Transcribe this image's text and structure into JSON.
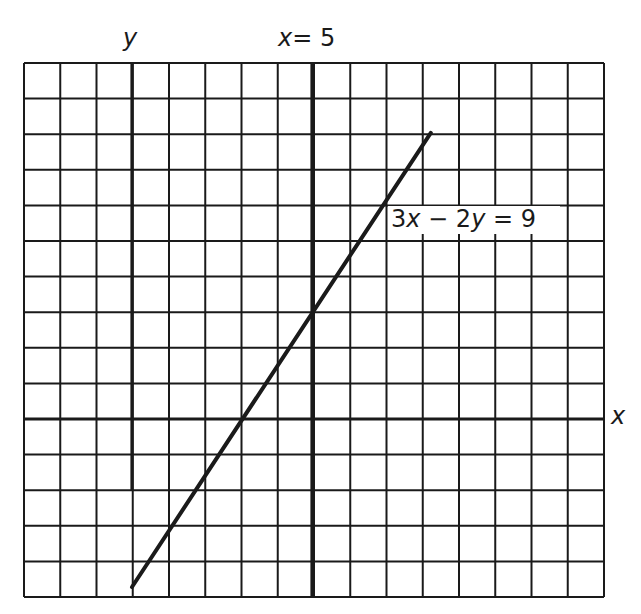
{
  "chart_data": {
    "type": "line",
    "title": "",
    "xlabel": "x",
    "ylabel": "y",
    "grid": true,
    "xlim": [
      -3,
      13.1
    ],
    "ylim": [
      -5,
      10
    ],
    "unit_px": 36,
    "axes": {
      "x_axis_label": "x",
      "y_axis_label": "y"
    },
    "series": [
      {
        "name": "3x − 2y = 9",
        "equation": "3x - 2y = 9",
        "x": [
          0,
          8.3
        ],
        "y": [
          -4.5,
          7.95
        ]
      },
      {
        "name": "x = 5",
        "equation": "x = 5",
        "x": [
          5,
          5
        ],
        "y": [
          -5,
          10
        ]
      }
    ],
    "annotations": [
      {
        "text": "3x − 2y = 9",
        "x": 7.2,
        "y": 5
      },
      {
        "text": "x = 5",
        "x": 5,
        "y": 10.4
      }
    ]
  },
  "labels": {
    "y_axis": "y",
    "x_axis": "x",
    "vertical_line_x": "x",
    "vertical_line_eq": "= 5",
    "line_eq_part1": "3",
    "line_eq_x": "x",
    "line_eq_minus": " − 2",
    "line_eq_y": "y",
    "line_eq_end": " = 9"
  },
  "colors": {
    "ink": "#1a1a1a",
    "background": "#ffffff"
  }
}
